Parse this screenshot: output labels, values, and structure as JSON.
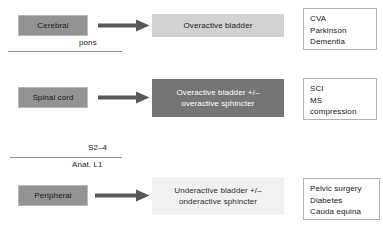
{
  "diagram": {
    "colors": {
      "source_box_fill": "#939393",
      "outcome_light_fill": "#d2d2d2",
      "outcome_lighter_fill": "#f1f1f1",
      "outcome_dark_fill": "#757575",
      "arrow": "#595959",
      "etiology_border": "#b0b0b0",
      "divider_line": "#8e8e8e",
      "text_dark": "#1a1a1a",
      "text_light": "#ffffff"
    },
    "rows": [
      {
        "id": "cerebral",
        "source": "Cerebral",
        "arrow": "arrow-right-icon",
        "outcome": "Overactive bladder",
        "outcome_style": "light",
        "etiologies": [
          "CVA",
          "Parkinson",
          "Dementia"
        ]
      },
      {
        "id": "spinal-cord",
        "source": "Spinal cord",
        "arrow": "arrow-right-icon",
        "outcome_lines": [
          "Overactive bladder +/–",
          "overactive sphincter"
        ],
        "outcome_style": "dark",
        "etiologies": [
          "SCI",
          "MS",
          "compression"
        ]
      },
      {
        "id": "peripheral",
        "source": "Peripheral",
        "arrow": "arrow-right-icon",
        "outcome_lines": [
          "Underactive bladder +/–",
          "onderactive sphincter"
        ],
        "outcome_style": "lighter",
        "etiologies": [
          "Pelvic surgery",
          "Diabetes",
          "Cauda equina"
        ]
      }
    ],
    "level_markers": [
      {
        "id": "pons",
        "label": "pons"
      },
      {
        "id": "s2-4",
        "label": "S2–4"
      },
      {
        "id": "anat-l1",
        "label": "Anat. L1"
      }
    ]
  }
}
